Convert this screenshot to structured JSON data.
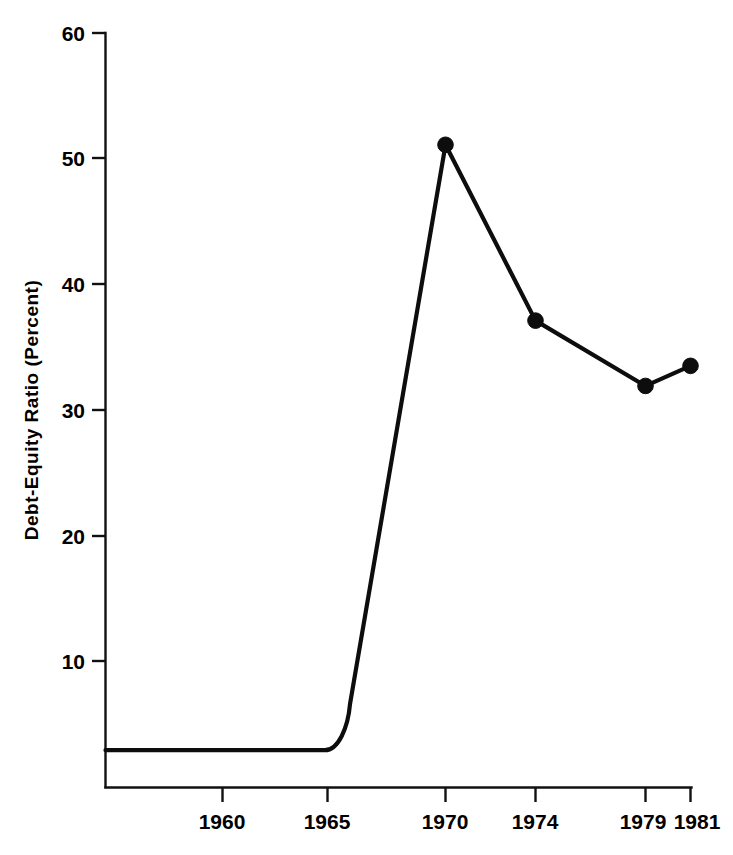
{
  "chart_data": {
    "type": "line",
    "title": "",
    "xlabel": "",
    "ylabel": "Debt-Equity Ratio (Percent)",
    "x": [
      1960,
      1965,
      1970,
      1974,
      1979,
      1981
    ],
    "xticklabels": [
      "1960",
      "1965",
      "1970",
      "1974",
      "1979",
      "1981"
    ],
    "yticklabels": [
      "10",
      "20",
      "30",
      "40",
      "50",
      "60"
    ],
    "yticks": [
      10,
      20,
      30,
      40,
      50,
      60
    ],
    "ylim": [
      0,
      60
    ],
    "xlim": [
      1956.5,
      1981
    ],
    "grid": false,
    "legend": null,
    "series": [
      {
        "name": "Debt-Equity Ratio",
        "values": [
          2.9,
          2.9,
          51.1,
          37.1,
          31.9,
          33.5
        ],
        "markers": [
          false,
          false,
          true,
          true,
          true,
          true
        ]
      }
    ],
    "points": [
      {
        "year": 1970,
        "value": 51.1,
        "marker": true
      },
      {
        "year": 1974,
        "value": 37.1,
        "marker": true
      },
      {
        "year": 1979,
        "value": 31.9,
        "marker": true
      },
      {
        "year": 1981,
        "value": 33.5,
        "marker": true
      }
    ],
    "baseline_value": 2.9,
    "colors": {
      "line": "#0d0d0d",
      "marker": "#0d0d0d",
      "axis": "#111111",
      "background": "#ffffff"
    }
  },
  "axes": {
    "y_title": "Debt-Equity Ratio (Percent)",
    "y_ticks": [
      {
        "label": "60",
        "value": 60
      },
      {
        "label": "50",
        "value": 50
      },
      {
        "label": "40",
        "value": 40
      },
      {
        "label": "30",
        "value": 30
      },
      {
        "label": "20",
        "value": 20
      },
      {
        "label": "10",
        "value": 10
      }
    ],
    "x_ticks": [
      {
        "label": "1960",
        "value": 1960
      },
      {
        "label": "1965",
        "value": 1965
      },
      {
        "label": "1970",
        "value": 1970
      },
      {
        "label": "1974",
        "value": 1974
      },
      {
        "label": "1979",
        "value": 1979
      },
      {
        "label": "1981",
        "value": 1981
      }
    ]
  }
}
